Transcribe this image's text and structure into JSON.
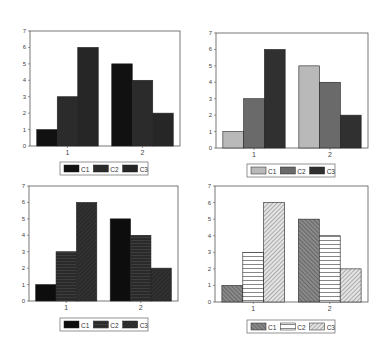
{
  "chart_data": [
    {
      "type": "bar",
      "title": "",
      "xlabel": "",
      "ylabel": "",
      "categories": [
        "1",
        "2"
      ],
      "ylim": [
        0,
        7
      ],
      "yticks": [
        "0",
        "1",
        "2",
        "3",
        "4",
        "5",
        "6",
        "7"
      ],
      "grid": false,
      "legend_position": "bottom",
      "series": [
        {
          "name": "C1",
          "values": [
            1,
            5
          ],
          "fill": "#111111",
          "pattern": "solid"
        },
        {
          "name": "C2",
          "values": [
            3,
            4
          ],
          "fill": "#2b2b2b",
          "pattern": "solid"
        },
        {
          "name": "C3",
          "values": [
            6,
            2
          ],
          "fill": "#262626",
          "pattern": "solid"
        }
      ]
    },
    {
      "type": "bar",
      "title": "",
      "xlabel": "",
      "ylabel": "",
      "categories": [
        "1",
        "2"
      ],
      "ylim": [
        0,
        7
      ],
      "yticks": [
        "0",
        "1",
        "2",
        "3",
        "4",
        "5",
        "6",
        "7"
      ],
      "grid": false,
      "legend_position": "bottom",
      "series": [
        {
          "name": "C1",
          "values": [
            1,
            5
          ],
          "fill": "#b9b9b9",
          "pattern": "solid"
        },
        {
          "name": "C2",
          "values": [
            3,
            4
          ],
          "fill": "#6a6a6a",
          "pattern": "solid"
        },
        {
          "name": "C3",
          "values": [
            6,
            2
          ],
          "fill": "#303030",
          "pattern": "solid"
        }
      ]
    },
    {
      "type": "bar",
      "title": "",
      "xlabel": "",
      "ylabel": "",
      "categories": [
        "1",
        "2"
      ],
      "ylim": [
        0,
        7
      ],
      "yticks": [
        "0",
        "1",
        "2",
        "3",
        "4",
        "5",
        "6",
        "7"
      ],
      "grid": false,
      "legend_position": "bottom",
      "series": [
        {
          "name": "C1",
          "values": [
            1,
            5
          ],
          "fill": "#0d0d0d",
          "pattern": "solid"
        },
        {
          "name": "C2",
          "values": [
            3,
            4
          ],
          "fill": "#2a2a2a",
          "pattern": "horizontal-dark"
        },
        {
          "name": "C3",
          "values": [
            6,
            2
          ],
          "fill": "#2c2c2c",
          "pattern": "diagonal-dark"
        }
      ]
    },
    {
      "type": "bar",
      "title": "",
      "xlabel": "",
      "ylabel": "",
      "categories": [
        "1",
        "2"
      ],
      "ylim": [
        0,
        7
      ],
      "yticks": [
        "0",
        "1",
        "2",
        "3",
        "4",
        "5",
        "6",
        "7"
      ],
      "grid": false,
      "legend_position": "bottom",
      "series": [
        {
          "name": "C1",
          "values": [
            1,
            5
          ],
          "fill": "#7a7a7a",
          "pattern": "forward-diagonal"
        },
        {
          "name": "C2",
          "values": [
            3,
            4
          ],
          "fill": "#ffffff",
          "pattern": "horizontal"
        },
        {
          "name": "C3",
          "values": [
            6,
            2
          ],
          "fill": "#cfcfcf",
          "pattern": "back-diagonal"
        }
      ]
    }
  ]
}
